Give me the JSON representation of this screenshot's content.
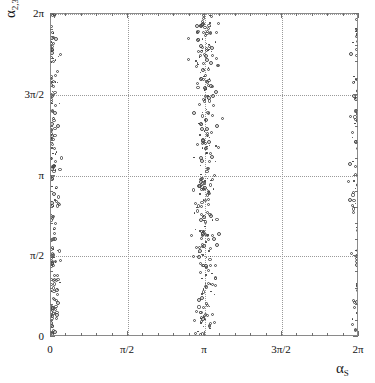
{
  "figure": {
    "background": "#ffffff",
    "frame_color": "#8a8a8a",
    "grid_color": "#9a9a9a",
    "marker_color": "#4a4a4a"
  },
  "axis_labels": {
    "y_symbol": "α",
    "y_subscript": "2,3",
    "x_symbol": "α",
    "x_subscript": "S"
  },
  "ticks": {
    "x": [
      "0",
      "π/2",
      "π",
      "3π/2",
      "2π"
    ],
    "y": [
      "0",
      "π/2",
      "π",
      "3π/2",
      "2π"
    ]
  },
  "chart_data": {
    "type": "scatter",
    "title": "",
    "xlabel": "α_S",
    "ylabel": "α_{2,3}",
    "xlim": [
      0,
      6.283185307179586
    ],
    "ylim": [
      0,
      6.283185307179586
    ],
    "xticks": [
      0,
      1.5707963,
      3.1415927,
      4.712389,
      6.2831853
    ],
    "xticklabels": [
      "0",
      "π/2",
      "π",
      "3π/2",
      "2π"
    ],
    "yticks": [
      0,
      1.5707963,
      3.1415927,
      4.712389,
      6.2831853
    ],
    "yticklabels": [
      "0",
      "π/2",
      "π",
      "3π/2",
      "2π"
    ],
    "minor_ticks_per_interval": 4,
    "grid": true,
    "grid_style": "dotted",
    "legend": null,
    "marker": "open-circle",
    "marker_size": 3,
    "clusters": [
      {
        "name": "band-at-0",
        "x_center": 0.0,
        "x_spread": 0.13,
        "n": 185
      },
      {
        "name": "band-at-pi",
        "x_center": 3.1415927,
        "x_spread": 0.2,
        "n": 300
      },
      {
        "name": "band-at-2pi",
        "x_center": 6.2831853,
        "x_spread": 0.13,
        "n": 195
      }
    ],
    "series": [
      {
        "name": "samples",
        "n_total": 680
      }
    ]
  }
}
